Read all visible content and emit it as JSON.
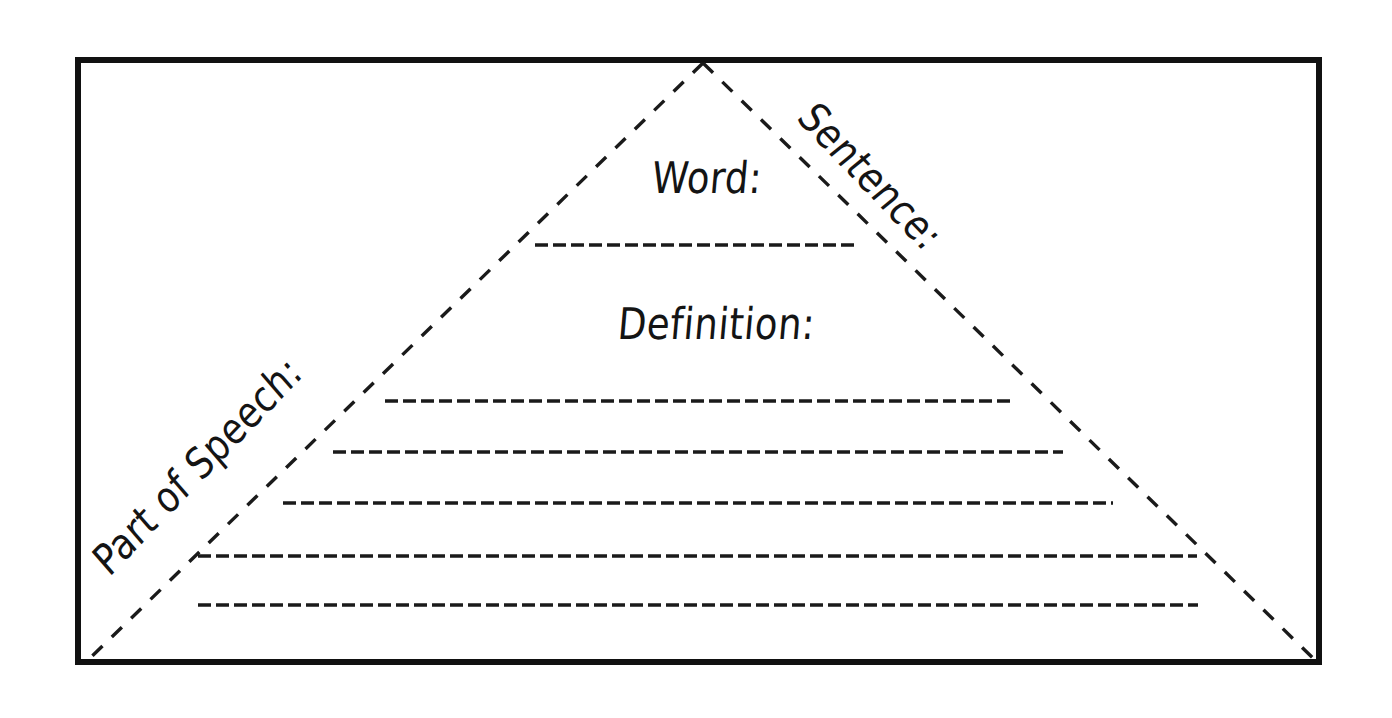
{
  "worksheet": {
    "title": "Vocabulary Pyramid Graphic Organizer",
    "background_color": "#ffffff",
    "ink_color": "#111111"
  },
  "frame": {
    "name": "outer-border",
    "style": "solid",
    "thickness_px": 6,
    "color": "#111111",
    "x": 75,
    "y": 57,
    "width": 1247,
    "height": 608
  },
  "pyramid": {
    "name": "dashed-triangle",
    "style": "dashed",
    "color": "#1a1a1a",
    "apex": {
      "x": 703,
      "y": 63
    },
    "bottom_left": {
      "x": 85,
      "y": 663
    },
    "bottom_right": {
      "x": 1318,
      "y": 663
    }
  },
  "labels": {
    "word": "Word:",
    "definition": "Definition:",
    "sentence": "Sentence:",
    "part_of_speech": "Part of Speech:"
  },
  "lines": {
    "word_line": {
      "x1": 535,
      "y1": 245,
      "x2": 858,
      "y2": 245
    },
    "definition_lines": [
      {
        "x1": 385,
        "y1": 401,
        "x2": 1012,
        "y2": 401
      },
      {
        "x1": 333,
        "y1": 452,
        "x2": 1063,
        "y2": 452
      },
      {
        "x1": 283,
        "y1": 503,
        "x2": 1113,
        "y2": 503
      },
      {
        "x1": 198,
        "y1": 556,
        "x2": 1197,
        "y2": 556
      },
      {
        "x1": 198,
        "y1": 605,
        "x2": 1198,
        "y2": 605
      }
    ]
  }
}
